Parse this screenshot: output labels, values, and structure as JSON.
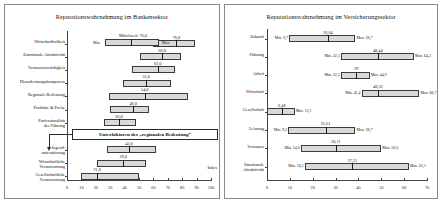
{
  "figure": {
    "panels": [
      "left",
      "right"
    ]
  },
  "left": {
    "title": "Reputationswahrnehmung im Bankensektor",
    "axis_label": "Index",
    "legend": {
      "mean_label": "Mittelwert:  76,0",
      "min_label": "Min.",
      "max_label": "Max."
    },
    "callout": "Unterfaktoren der „regionalen Bedeutung“",
    "xaxis": {
      "min": 0,
      "max": 100,
      "ticks": [
        0,
        10,
        20,
        30,
        40,
        50,
        60,
        70,
        80,
        90,
        100
      ],
      "ticklabels": [
        "0",
        "10",
        "20",
        "30",
        "40",
        "50",
        "60",
        "70",
        "80",
        "90",
        "100"
      ]
    },
    "categories": [
      "Wirtschaftlichkeit",
      "Emotionale Attraktivität",
      "Vertrauenswürdigkeit",
      "Dienstleistungskompetenz",
      "Regionale Bedeutung",
      "Produkte & Preise",
      "Professionalität\nder Führung",
      "Jugend-\nunterstützung",
      "Wirtschaftliche\nVerantwortung",
      "Gesellschaftliche\nVerantwortung"
    ]
  },
  "right": {
    "title": "Reputationswahrnehmung im Versicherungssektor",
    "xaxis": {
      "min": 0,
      "max": 70,
      "ticks": [
        0,
        10,
        20,
        30,
        40,
        50,
        60,
        70
      ],
      "ticklabels": [
        "0",
        "10",
        "20",
        "30",
        "40",
        "50",
        "60",
        "70"
      ]
    },
    "categories": [
      "Zukunft",
      "Führung",
      "Arbeit",
      "Wirtschaft",
      "Gesellschaft",
      "Leistung",
      "Vertrauen",
      "Emotionale\nAttraktivität"
    ]
  },
  "chart_data": [
    {
      "type": "bar",
      "subtype": "min-mean-max range bars (boxplot-style)",
      "title": "Reputationswahrnehmung im Bankensektor",
      "xlabel": "Index",
      "ylabel": "",
      "xlim": [
        0,
        100
      ],
      "xticks": [
        0,
        10,
        20,
        30,
        40,
        50,
        60,
        70,
        80,
        90,
        100
      ],
      "grid": false,
      "legend": "Mittelwert / Min. / Max.",
      "legend_position": "top-right inside plot",
      "categories": [
        "Wirtschaftlichkeit",
        "Emotionale Attraktivität",
        "Vertrauenswürdigkeit",
        "Dienstleistungskompetenz",
        "Regionale Bedeutung",
        "Produkte & Preise",
        "Professionalität der Führung",
        "Jugendunterstützung",
        "Wirtschaftliche Verantwortung",
        "Gesellschaftliche Verantwortung"
      ],
      "series": [
        {
          "name": "Min.",
          "values": [
            60,
            51,
            45,
            39,
            29,
            30,
            26,
            28,
            21,
            10
          ]
        },
        {
          "name": "Mittelwert",
          "values": [
            76.0,
            66.0,
            63.0,
            55.0,
            54.0,
            46.0,
            36.0,
            43.0,
            39.0,
            21.0
          ]
        },
        {
          "name": "Max.",
          "values": [
            89,
            79,
            75,
            72,
            84,
            57,
            48,
            62,
            55,
            50
          ]
        }
      ],
      "mean_labels": [
        "76,0",
        "66,0",
        "63,0",
        "55,0",
        "54,0",
        "46,0",
        "36,0",
        "43,0",
        "39,0",
        "21,0"
      ],
      "annotations": [
        "Mittelwert:  76,0",
        "Min.",
        "Max.",
        "Unterfaktoren der „regionalen Bedeutung“",
        "Index"
      ]
    },
    {
      "type": "bar",
      "subtype": "min-mean-max range bars (boxplot-style)",
      "title": "Reputationswahrnehmung im Versicherungssektor",
      "xlabel": "",
      "ylabel": "",
      "xlim": [
        0,
        70
      ],
      "xticks": [
        0,
        10,
        20,
        30,
        40,
        50,
        60,
        70
      ],
      "grid": false,
      "categories": [
        "Zukunft",
        "Führung",
        "Arbeit",
        "Wirtschaft",
        "Gesellschaft",
        "Leistung",
        "Vertrauen",
        "Emotionale Attraktivität"
      ],
      "series": [
        {
          "name": "Min.",
          "values": [
            9.7,
            32.3,
            32.3,
            41.4,
            0.0,
            9.3,
            14.8,
            16.5
          ]
        },
        {
          "name": "Mittelwert",
          "values": [
            26.64,
            48.44,
            39.0,
            48.52,
            6.48,
            25.61,
            30.11,
            37.31
          ]
        },
        {
          "name": "Max.",
          "values": [
            38.7,
            64.3,
            44.9,
            66.7,
            12.1,
            38.7,
            50.0,
            62.1
          ]
        }
      ],
      "mean_labels": [
        "26,64",
        "48,44",
        "39",
        "48,52",
        "6,48",
        "25,61",
        "30,11",
        "37,31"
      ],
      "min_labels": [
        "Min. 9,7",
        "Min. 32,3",
        "Min. 32,3",
        "Min. 41,4",
        "",
        "Min. 9,3",
        "Min. 14,8",
        "Min. 16,5"
      ],
      "max_labels": [
        "Max. 38,7",
        "Max. 64,3",
        "Max. 44,9",
        "Max. 66,7",
        "Max. 12,1",
        "Max. 38,7",
        "Max. 50,0",
        "Max. 62,1"
      ]
    }
  ]
}
